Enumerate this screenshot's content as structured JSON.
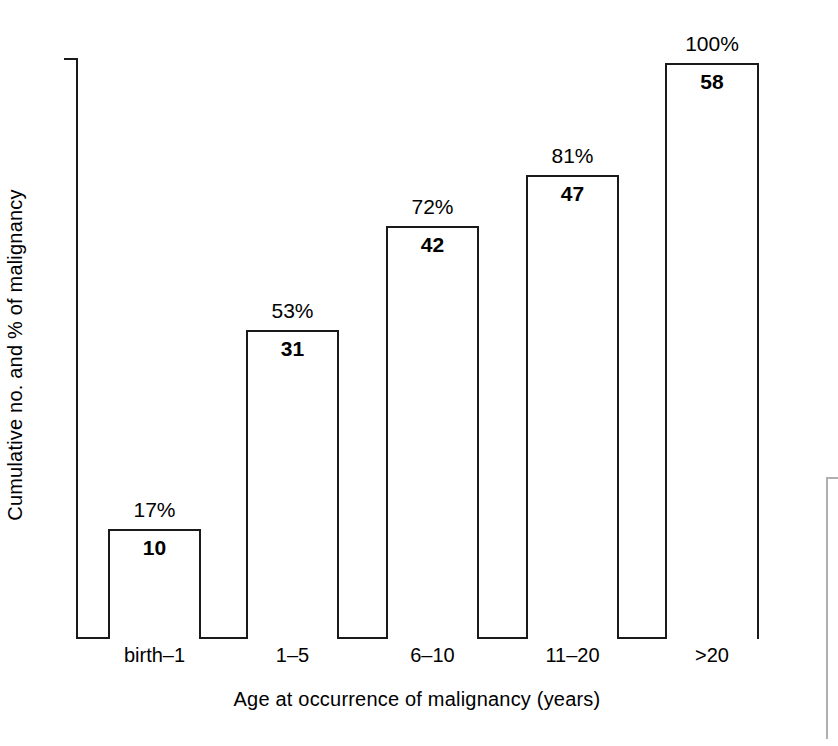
{
  "chart_data": {
    "type": "bar",
    "title": "",
    "xlabel": "Age at occurrence of malignancy (years)",
    "ylabel": "Cumulative no. and % of malignancy",
    "categories": [
      "birth–1",
      "1–5",
      "6–10",
      "11–20",
      ">20"
    ],
    "values": [
      10,
      31,
      42,
      47,
      58
    ],
    "value_labels": [
      "10",
      "31",
      "42",
      "47",
      "58"
    ],
    "percent_values": [
      17,
      53,
      72,
      81,
      100
    ],
    "percent_labels": [
      "17%",
      "53%",
      "72%",
      "81%",
      "100%"
    ],
    "ylim": [
      0,
      58
    ],
    "grid": false,
    "legend": null,
    "bar_style": "outline",
    "bar_fill_color": "#ffffff",
    "bar_stroke_color": "#1a1a1a",
    "axis_color": "#1a1a1a",
    "background_color": "#ffffff",
    "cumulative": true,
    "axis_ticks_visible": false
  },
  "bars": [
    {
      "category": "birth–1",
      "value_label": "10",
      "percent_label": "17%",
      "left": 108,
      "width": 93,
      "top": 529,
      "height": 110,
      "label_left": 108,
      "label_width": 93,
      "value_top": 536,
      "pct_top": 498,
      "cat_top": 644
    },
    {
      "category": "1–5",
      "value_label": "31",
      "percent_label": "53%",
      "left": 246,
      "width": 93,
      "top": 330,
      "height": 309,
      "label_left": 246,
      "label_width": 93,
      "value_top": 337,
      "pct_top": 299,
      "cat_top": 644
    },
    {
      "category": "6–10",
      "value_label": "42",
      "percent_label": "72%",
      "left": 386,
      "width": 93,
      "top": 226,
      "height": 413,
      "label_left": 386,
      "label_width": 93,
      "value_top": 233,
      "pct_top": 195,
      "cat_top": 644
    },
    {
      "category": "11–20",
      "value_label": "47",
      "percent_label": "81%",
      "left": 526,
      "width": 93,
      "top": 175,
      "height": 464,
      "label_left": 526,
      "label_width": 93,
      "value_top": 182,
      "pct_top": 144,
      "cat_top": 644
    },
    {
      "category": ">20",
      "value_label": "58",
      "percent_label": "100%",
      "left": 665,
      "width": 94,
      "top": 63,
      "height": 576,
      "label_left": 665,
      "label_width": 94,
      "value_top": 70,
      "pct_top": 32,
      "cat_top": 644
    }
  ]
}
